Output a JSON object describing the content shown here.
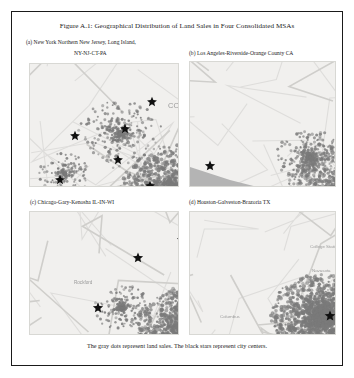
{
  "figure": {
    "title": "Figure A.1: Geographical Distribution of Land Sales in Four Consolidated MSAs",
    "caption": "The gray dots represent land sales. The black stars represent city centers."
  },
  "panels": [
    {
      "id": "a",
      "label_line1": "(a) New York Northern New Jersey, Long Island,",
      "label_line2": "NY-NJ-CT-PA",
      "map_name": "map-new-york",
      "water_label": "Atlantic Ocean",
      "place_labels": [
        "CONNECTICUT",
        "Hartford",
        "New Haven",
        "Philadelphia",
        "Allentown",
        "Scranton",
        "NEW JERSEY",
        "Prov"
      ]
    },
    {
      "id": "b",
      "label_line1": "(b) Los Angeles-Riverside-Orange County CA",
      "label_line2": "",
      "map_name": "map-los-angeles",
      "water_label": "Pacific Ocean",
      "place_labels": [
        "Los Angeles",
        "Santa Barbara",
        "Bakersfield",
        "San Bernardino",
        "Riverside",
        "Palm Springs",
        "Long Beach"
      ]
    },
    {
      "id": "c",
      "label_line1": "(c) Chicago-Gary-Kenosha IL-IN-WI",
      "label_line2": "",
      "map_name": "map-chicago",
      "water_label": "Lake Michigan",
      "place_labels": [
        "Chicago",
        "Milwaukee",
        "Rockford",
        "Gary",
        "Joliet",
        "South Bend",
        "Kankakee"
      ]
    },
    {
      "id": "d",
      "label_line1": "(d) Houston-Galveston-Brazoria TX",
      "label_line2": "",
      "map_name": "map-houston",
      "water_label": "Gulf of Mexico",
      "place_labels": [
        "Houston",
        "Galveston",
        "Beaumont",
        "College Station",
        "Bay City",
        "El Campo",
        "Columbus",
        "Navasota"
      ]
    }
  ],
  "legend": {
    "dot_meaning": "land sales",
    "dot_color": "#7a7a7a",
    "star_meaning": "city centers",
    "star_color": "#101010"
  },
  "colors": {
    "frame_border": "#1a1a1a",
    "page_background": "#ffffff",
    "map_land": "#f1f0ee",
    "map_water": "#b4b4b4",
    "text": "#1b1b1b"
  }
}
